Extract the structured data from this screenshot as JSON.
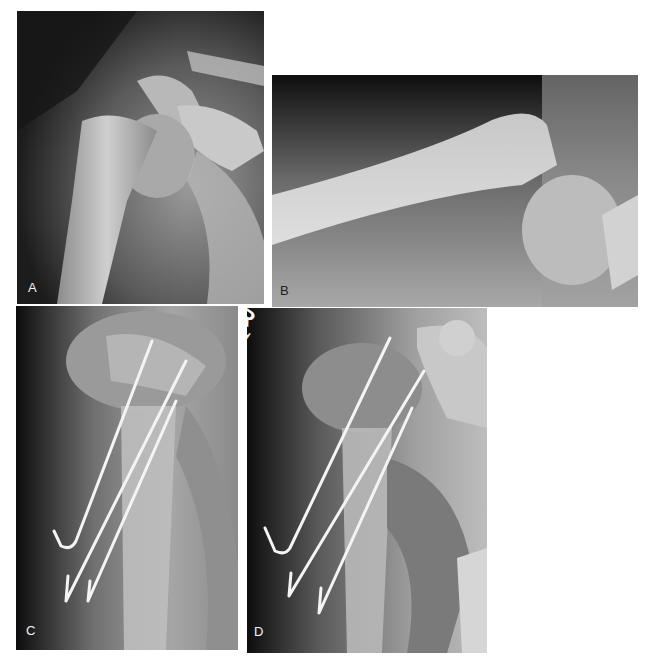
{
  "figure": {
    "panels": [
      {
        "id": "A",
        "label": "A",
        "description": "AP radiograph of proximal humerus with displaced physeal fracture"
      },
      {
        "id": "B",
        "label": "B",
        "description": "Lateral radiograph showing displaced humeral head"
      },
      {
        "id": "C",
        "label": "C",
        "description": "Radiograph after percutaneous pin fixation with three pins"
      },
      {
        "id": "D",
        "label": "D",
        "description": "Radiograph after percutaneous pin fixation with three pins"
      }
    ],
    "markers": {
      "side": "R",
      "initials": "PFH"
    },
    "caption": ""
  }
}
